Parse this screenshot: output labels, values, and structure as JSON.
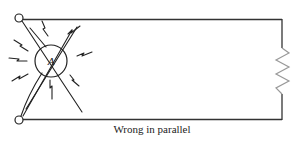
{
  "figure": {
    "caption": "Wrong in parallel",
    "components": {
      "meter": {
        "symbol": "A",
        "type": "ammeter",
        "state": "damaged (sparks)"
      },
      "load": {
        "type": "resistor"
      },
      "terminals": [
        "top-left-terminal",
        "bottom-left-terminal"
      ]
    },
    "colors": {
      "wire": "#333333",
      "resistor": "#999999",
      "background": "#ffffff"
    }
  }
}
